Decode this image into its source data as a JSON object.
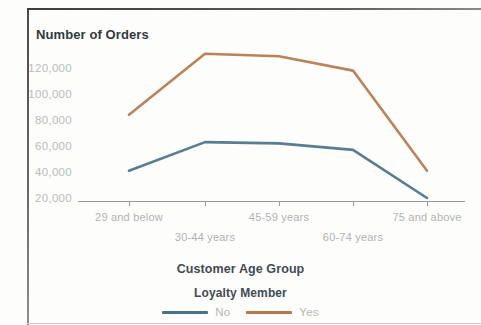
{
  "chart_data": {
    "type": "line",
    "title": "Number of Orders",
    "xlabel": "Customer Age Group",
    "ylabel": "Number of Orders",
    "categories": [
      "29 and below",
      "30-44 years",
      "45-59 years",
      "60-74 years",
      "75 and above"
    ],
    "ytick_labels": [
      "120,000",
      "100,000",
      "80,000",
      "60,000",
      "40,000",
      "20,000"
    ],
    "ytick_values": [
      120000,
      100000,
      80000,
      60000,
      40000,
      20000
    ],
    "ylim": [
      20000,
      140000
    ],
    "grid": false,
    "legend_title": "Loyalty Member",
    "legend_position": "bottom",
    "series": [
      {
        "name": "No",
        "color": "#4a7287",
        "values": [
          41000,
          63000,
          62000,
          57000,
          20000
        ]
      },
      {
        "name": "Yes",
        "color": "#b5784a",
        "values": [
          84000,
          131000,
          129000,
          118000,
          41000
        ]
      }
    ]
  },
  "axis": {
    "tick_x": [
      129,
      205,
      279,
      353,
      427
    ]
  }
}
